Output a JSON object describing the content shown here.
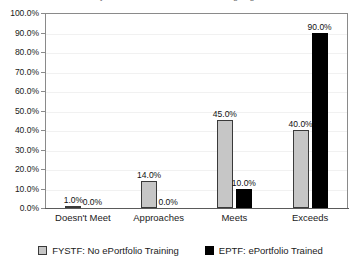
{
  "chart_data": {
    "type": "bar",
    "title": "",
    "xlabel": "",
    "ylabel": "",
    "ylim": [
      0,
      100
    ],
    "ytick_labels": [
      "100.0%",
      "90.0%",
      "80.0%",
      "70.0%",
      "60.0%",
      "50.0%",
      "40.0%",
      "30.0%",
      "20.0%",
      "10.0%",
      "0.0%"
    ],
    "ytick_values": [
      100,
      90,
      80,
      70,
      60,
      50,
      40,
      30,
      20,
      10,
      0
    ],
    "grid": true,
    "legend_position": "bottom",
    "categories": [
      "Doesn't Meet",
      "Approaches",
      "Meets",
      "Exceeds"
    ],
    "series": [
      {
        "name": "FYSTF: No ePortfolio Training",
        "color": "#c6c6c6",
        "values": [
          1.0,
          14.0,
          45.0,
          40.0
        ],
        "labels": [
          "1.0%",
          "14.0%",
          "45.0%",
          "40.0%"
        ]
      },
      {
        "name": "EPTF: ePortfolio Trained",
        "color": "#000000",
        "values": [
          0.0,
          0.0,
          10.0,
          90.0
        ],
        "labels": [
          "0.0%",
          "0.0%",
          "10.0%",
          "90.0%"
        ]
      }
    ]
  },
  "legend": {
    "items": [
      {
        "label": "FYSTF: No ePortfolio Training",
        "swatch": "gray-square-icon"
      },
      {
        "label": "EPTF: ePortfolio Trained",
        "swatch": "black-square-icon"
      }
    ]
  },
  "title_sliver": {
    "text": "Study of ePortfolio use: Critical thinking alignment"
  }
}
